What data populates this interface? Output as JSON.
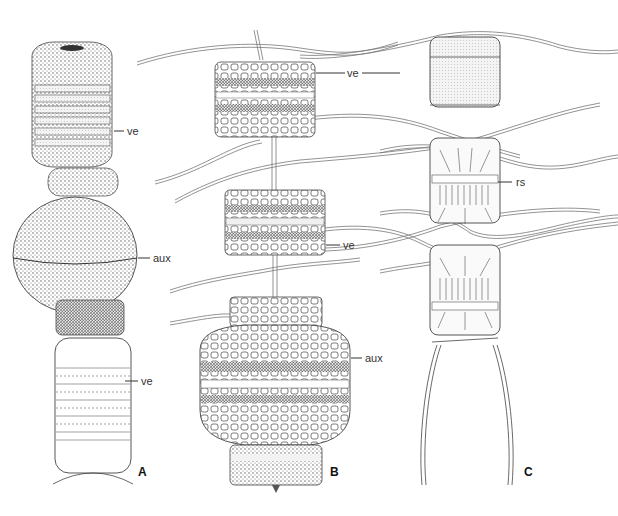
{
  "figure": {
    "panels": [
      {
        "id": "A",
        "letter": "A",
        "labels": [
          "ve",
          "aux",
          "ve"
        ]
      },
      {
        "id": "B",
        "letter": "B",
        "labels": [
          "ve",
          "ve",
          "aux"
        ]
      },
      {
        "id": "C",
        "letter": "C",
        "labels": [
          "rs"
        ]
      }
    ],
    "labels": {
      "a_ve_top": "ve",
      "a_aux": "aux",
      "a_ve_bottom": "ve",
      "b_ve_top": "ve",
      "b_ve_mid": "ve",
      "b_aux": "aux",
      "c_rs": "rs"
    },
    "letters": {
      "a": "A",
      "b": "B",
      "c": "C"
    }
  }
}
